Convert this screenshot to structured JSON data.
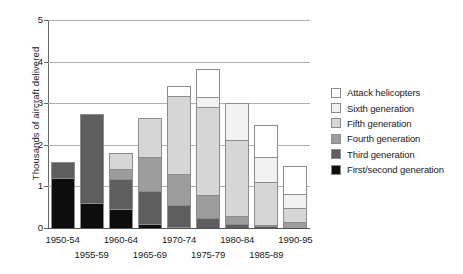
{
  "chart_data": {
    "type": "bar",
    "subtype": "stacked-vertical",
    "title": "",
    "xlabel": "",
    "ylabel": "Thousands of aircraft delivered",
    "ylim": [
      0,
      5
    ],
    "ytick_values": [
      0,
      1,
      2,
      3,
      4,
      5
    ],
    "ytick_labels": [
      "0",
      "1",
      "2",
      "3",
      "4",
      "5"
    ],
    "grid": true,
    "grid_axis": "y",
    "legend_position": "right",
    "categories": [
      "1950-54",
      "1955-59",
      "1960-64",
      "1965-69",
      "1970-74",
      "1975-79",
      "1980-84",
      "1985-89",
      "1990-95"
    ],
    "series": [
      {
        "name": "First/second generation",
        "color": "#0d0d0d",
        "values": [
          1.2,
          0.6,
          0.45,
          0.1,
          0.02,
          0.0,
          0.0,
          0.0,
          0.0
        ]
      },
      {
        "name": "Third generation",
        "color": "#5e5e5e",
        "values": [
          0.4,
          2.15,
          0.75,
          0.8,
          0.55,
          0.25,
          0.1,
          0.05,
          0.0
        ]
      },
      {
        "name": "Fourth generation",
        "color": "#9c9c9c",
        "values": [
          0.0,
          0.0,
          0.25,
          0.85,
          0.75,
          0.55,
          0.2,
          0.05,
          0.15
        ]
      },
      {
        "name": "Fifth generation",
        "color": "#d6d6d6",
        "values": [
          0.0,
          0.0,
          0.4,
          0.95,
          1.9,
          2.15,
          1.85,
          1.05,
          0.35
        ]
      },
      {
        "name": "Sixth generation",
        "color": "#f2f2f2",
        "values": [
          0.0,
          0.0,
          0.0,
          0.0,
          0.0,
          0.25,
          0.9,
          0.6,
          0.35
        ]
      },
      {
        "name": "Attack helicopters",
        "color": "#ffffff",
        "values": [
          0.0,
          0.0,
          0.0,
          0.0,
          0.25,
          0.7,
          0.0,
          0.8,
          0.7
        ]
      }
    ],
    "totals": [
      1.6,
      2.75,
      1.85,
      2.7,
      3.47,
      3.9,
      3.05,
      2.55,
      1.55
    ]
  },
  "legend": {
    "items": [
      {
        "label": "Attack helicopters",
        "color": "#ffffff"
      },
      {
        "label": "Sixth generation",
        "color": "#f2f2f2"
      },
      {
        "label": "Fifth generation",
        "color": "#d6d6d6"
      },
      {
        "label": "Fourth generation",
        "color": "#9c9c9c"
      },
      {
        "label": "Third generation",
        "color": "#5e5e5e"
      },
      {
        "label": "First/second generation",
        "color": "#0d0d0d"
      }
    ]
  }
}
